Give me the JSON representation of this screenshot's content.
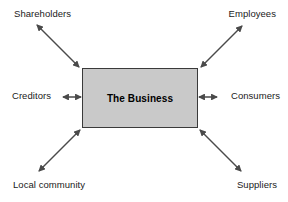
{
  "diagram": {
    "center": {
      "label": "The Business",
      "fill_color": "#c9c9c9",
      "border_color": "#3a3a3a"
    },
    "arrow_color": "#4a4a4a",
    "background_color": "#ffffff",
    "stakeholders": [
      {
        "id": "shareholders",
        "label": "Shareholders",
        "position": "top-left",
        "arrow": "double-headed-diagonal"
      },
      {
        "id": "employees",
        "label": "Employees",
        "position": "top-right",
        "arrow": "double-headed-diagonal"
      },
      {
        "id": "creditors",
        "label": "Creditors",
        "position": "middle-left",
        "arrow": "double-headed-horizontal"
      },
      {
        "id": "consumers",
        "label": "Consumers",
        "position": "middle-right",
        "arrow": "double-headed-horizontal"
      },
      {
        "id": "local-community",
        "label": "Local community",
        "position": "bottom-left",
        "arrow": "double-headed-diagonal"
      },
      {
        "id": "suppliers",
        "label": "Suppliers",
        "position": "bottom-right",
        "arrow": "double-headed-diagonal"
      }
    ]
  }
}
